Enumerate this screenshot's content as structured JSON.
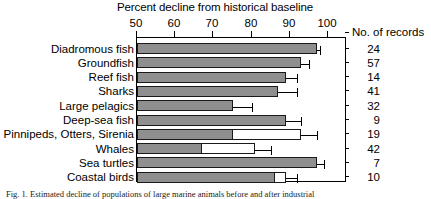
{
  "chart_data": {
    "type": "bar",
    "orientation": "horizontal",
    "title": "Percent decline from historical baseline",
    "xlabel": "Percent decline from historical baseline",
    "ylabel": "",
    "xlim": [
      50,
      103
    ],
    "xticks": [
      50,
      60,
      70,
      80,
      90,
      100
    ],
    "xtick_labels": [
      "50",
      "60",
      "70",
      "80",
      "90",
      "100"
    ],
    "grid": false,
    "legend": null,
    "axis_position": "top",
    "categories": [
      "Diadromous fish",
      "Groundfish",
      "Reef fish",
      "Sharks",
      "Large pelagics",
      "Deep-sea fish",
      "Pinnipeds, Otters, Sirenia",
      "Whales",
      "Sea turtles",
      "Coastal birds"
    ],
    "values": [
      97,
      93,
      89,
      87,
      75,
      89,
      75,
      67,
      97,
      86
    ],
    "values_outer": [
      97,
      93,
      89,
      87,
      75,
      89,
      93,
      81,
      97,
      89
    ],
    "error_upper": [
      98,
      95,
      92,
      92,
      80,
      93,
      97,
      85,
      99,
      92
    ],
    "series": [
      {
        "name": "Filled (gray) extent",
        "values": [
          97,
          93,
          89,
          87,
          75,
          89,
          75,
          67,
          97,
          86
        ]
      },
      {
        "name": "Open (white) extent",
        "values": [
          null,
          null,
          null,
          null,
          null,
          null,
          93,
          81,
          null,
          89
        ]
      },
      {
        "name": "Upper error limit",
        "values": [
          98,
          95,
          92,
          92,
          80,
          93,
          97,
          85,
          99,
          92
        ]
      }
    ],
    "records_header": "No. of records",
    "records": [
      24,
      57,
      14,
      41,
      32,
      9,
      19,
      42,
      7,
      10
    ],
    "colors": {
      "bar_fill": "#8f8f8f",
      "bar_open": "#ffffff",
      "bar_edge": "#1a1a1a",
      "axis": "#000000",
      "text": "#000000"
    }
  },
  "caption": {
    "text": "Fig. 1. Estimated decline of populations of large marine animals before and after industrial"
  }
}
